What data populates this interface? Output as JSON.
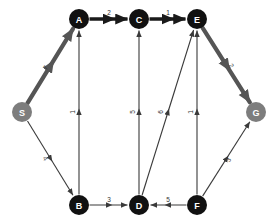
{
  "diagram": {
    "colors": {
      "node_fill": "#111111",
      "terminal_node_fill": "#7d7d7d",
      "node_text": "#ffffff",
      "edge_stroke": "#3a3a3a",
      "highlight_stroke": "#555555",
      "bold_stroke": "#1a1a1a",
      "background": "#ffffff"
    },
    "nodes": [
      {
        "id": "S",
        "label": "S",
        "x": 22,
        "y": 112,
        "style": "terminal",
        "r": 10
      },
      {
        "id": "A",
        "label": "A",
        "x": 79,
        "y": 19,
        "style": "normal",
        "r": 10
      },
      {
        "id": "C",
        "label": "C",
        "x": 139,
        "y": 19,
        "style": "normal",
        "r": 10
      },
      {
        "id": "E",
        "label": "E",
        "x": 197,
        "y": 19,
        "style": "normal",
        "r": 10
      },
      {
        "id": "G",
        "label": "G",
        "x": 256,
        "y": 112,
        "style": "terminal",
        "r": 10
      },
      {
        "id": "B",
        "label": "B",
        "x": 79,
        "y": 205,
        "style": "normal",
        "r": 10
      },
      {
        "id": "D",
        "label": "D",
        "x": 139,
        "y": 205,
        "style": "normal",
        "r": 10
      },
      {
        "id": "F",
        "label": "F",
        "x": 197,
        "y": 205,
        "style": "normal",
        "r": 10
      }
    ],
    "edges": [
      {
        "id": "S-A",
        "from": "S",
        "to": "A",
        "weight": "7",
        "style": "highlight",
        "label_x": 46,
        "label_y": 68,
        "label_rot": -58
      },
      {
        "id": "A-C",
        "from": "A",
        "to": "C",
        "weight": "2",
        "style": "bold",
        "label_x": 109,
        "label_y": 13,
        "label_rot": 0
      },
      {
        "id": "C-E",
        "from": "C",
        "to": "E",
        "weight": "1",
        "style": "bold",
        "label_x": 168,
        "label_y": 13,
        "label_rot": 0
      },
      {
        "id": "E-G",
        "from": "E",
        "to": "G",
        "weight": "2",
        "style": "highlight",
        "label_x": 231,
        "label_y": 66,
        "label_rot": 58
      },
      {
        "id": "S-B",
        "from": "S",
        "to": "B",
        "weight": "4",
        "style": "plain",
        "label_x": 45,
        "label_y": 159,
        "label_rot": 58
      },
      {
        "id": "B-A",
        "from": "B",
        "to": "A",
        "weight": "1",
        "style": "plain",
        "label_x": 73,
        "label_y": 112,
        "label_rot": -90
      },
      {
        "id": "B-D",
        "from": "B",
        "to": "D",
        "weight": "3",
        "style": "plain",
        "label_x": 109,
        "label_y": 200,
        "label_rot": 0
      },
      {
        "id": "D-C",
        "from": "D",
        "to": "C",
        "weight": "5",
        "style": "plain",
        "label_x": 133,
        "label_y": 112,
        "label_rot": -90
      },
      {
        "id": "D-E",
        "from": "D",
        "to": "E",
        "weight": "6",
        "style": "plain",
        "label_x": 161,
        "label_y": 112,
        "label_rot": -90
      },
      {
        "id": "F-D",
        "from": "F",
        "to": "D",
        "weight": "5",
        "style": "plain",
        "label_x": 168,
        "label_y": 200,
        "label_rot": 0
      },
      {
        "id": "F-E",
        "from": "F",
        "to": "E",
        "weight": "1",
        "style": "plain",
        "label_x": 191,
        "label_y": 112,
        "label_rot": -90
      },
      {
        "id": "F-G",
        "from": "F",
        "to": "G",
        "weight": "3",
        "style": "plain",
        "label_x": 229,
        "label_y": 160,
        "label_rot": -58
      }
    ],
    "highlighted_path": [
      "S",
      "A",
      "C",
      "E",
      "G"
    ]
  }
}
